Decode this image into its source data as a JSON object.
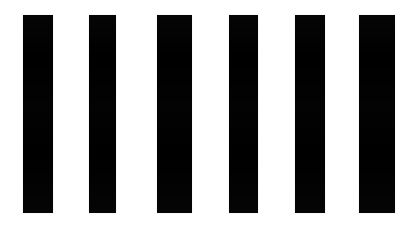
{
  "image": {
    "title": "Six black vertical bars on white background",
    "kind": "scanned-barcode-like-pattern",
    "width": 413,
    "height": 229,
    "background_color": "#ffffff",
    "bar_color": "#000000"
  },
  "chart_data": {
    "type": "bar",
    "xlabel": "",
    "ylabel": "",
    "grid": false,
    "legend": false,
    "categories": [
      "1",
      "2",
      "3",
      "4",
      "5",
      "6"
    ],
    "values": [
      198,
      198,
      198,
      198,
      198,
      198
    ],
    "xlim": [
      0,
      413
    ],
    "ylim": [
      0,
      229
    ],
    "bar_color": "#000000",
    "background_color": "#ffffff",
    "bars": [
      {
        "index": 1,
        "x": 23,
        "y": 15,
        "width": 30,
        "height": 198
      },
      {
        "index": 2,
        "x": 89,
        "y": 15,
        "width": 27,
        "height": 198
      },
      {
        "index": 3,
        "x": 157,
        "y": 15,
        "width": 35,
        "height": 198
      },
      {
        "index": 4,
        "x": 229,
        "y": 15,
        "width": 29,
        "height": 198
      },
      {
        "index": 5,
        "x": 295,
        "y": 15,
        "width": 30,
        "height": 198
      },
      {
        "index": 6,
        "x": 359,
        "y": 15,
        "width": 36,
        "height": 198
      }
    ]
  }
}
